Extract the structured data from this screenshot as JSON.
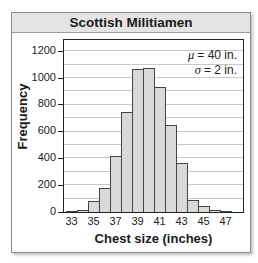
{
  "chart_data": {
    "type": "bar",
    "title": "Scottish Militiamen",
    "xlabel": "Chest size (inches)",
    "ylabel": "Frequency",
    "categories": [
      "33",
      "34",
      "35",
      "36",
      "37",
      "38",
      "39",
      "40",
      "41",
      "42",
      "43",
      "44",
      "45",
      "46",
      "47"
    ],
    "values": [
      3,
      18,
      80,
      180,
      415,
      745,
      1070,
      1075,
      930,
      650,
      365,
      90,
      45,
      18,
      3
    ],
    "x_tick_labels": [
      "33",
      "35",
      "37",
      "39",
      "41",
      "43",
      "45",
      "47"
    ],
    "y_tick_labels": [
      "0",
      "200",
      "400",
      "600",
      "800",
      "1000",
      "1200"
    ],
    "ylim": [
      0,
      1300
    ],
    "grid": true,
    "gridline_step": 100,
    "annotations": [
      "μ = 40 in.",
      "σ = 2 in."
    ],
    "bar_color": "#d9d9d9",
    "header_color": "#e4e4e4"
  },
  "annotation": {
    "mu_symbol": "μ",
    "mu_text": "= 40 in.",
    "sigma_symbol": "σ",
    "sigma_text": "= 2 in."
  }
}
